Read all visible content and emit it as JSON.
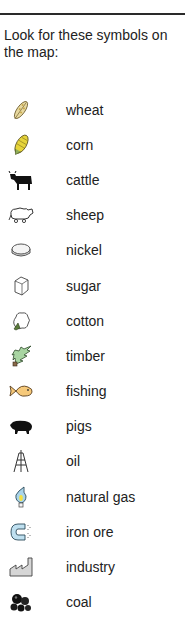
{
  "intro": {
    "text": "Look for these symbols on the map:"
  },
  "legend": {
    "items": [
      {
        "label": "wheat",
        "icon": "wheat-icon"
      },
      {
        "label": "corn",
        "icon": "corn-icon"
      },
      {
        "label": "cattle",
        "icon": "cattle-icon"
      },
      {
        "label": "sheep",
        "icon": "sheep-icon"
      },
      {
        "label": "nickel",
        "icon": "nickel-icon"
      },
      {
        "label": "sugar",
        "icon": "sugar-icon"
      },
      {
        "label": "cotton",
        "icon": "cotton-icon"
      },
      {
        "label": "timber",
        "icon": "timber-icon"
      },
      {
        "label": "fishing",
        "icon": "fishing-icon"
      },
      {
        "label": "pigs",
        "icon": "pigs-icon"
      },
      {
        "label": "oil",
        "icon": "oil-icon"
      },
      {
        "label": "natural gas",
        "icon": "natural-gas-icon"
      },
      {
        "label": "iron ore",
        "icon": "iron-ore-icon"
      },
      {
        "label": "industry",
        "icon": "industry-icon"
      },
      {
        "label": "coal",
        "icon": "coal-icon"
      }
    ]
  },
  "colors": {
    "rule": "#2a2a2a",
    "timber": "#a8d5a2",
    "fish": "#f6c97a",
    "gas_flame": "#a9d4ea",
    "magnet": "#bfe0f0"
  }
}
